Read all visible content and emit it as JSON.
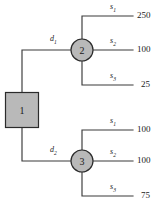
{
  "diagram": {
    "type": "decision-tree",
    "nodes": [
      {
        "id": "1",
        "label": "1",
        "shape": "square",
        "kind": "decision"
      },
      {
        "id": "2",
        "label": "2",
        "shape": "circle",
        "kind": "chance"
      },
      {
        "id": "3",
        "label": "3",
        "shape": "circle",
        "kind": "chance"
      }
    ],
    "decision_branches": [
      {
        "id": "d1",
        "label": "d",
        "sub": "1",
        "from": "1",
        "to": "2"
      },
      {
        "id": "d2",
        "label": "d",
        "sub": "2",
        "from": "1",
        "to": "3"
      }
    ],
    "outcome_branches": [
      {
        "id": "n2-s1",
        "node": "2",
        "label": "s",
        "sub": "1",
        "payoff": "250"
      },
      {
        "id": "n2-s2",
        "node": "2",
        "label": "s",
        "sub": "2",
        "payoff": "100"
      },
      {
        "id": "n2-s3",
        "node": "2",
        "label": "s",
        "sub": "3",
        "payoff": "25"
      },
      {
        "id": "n3-s1",
        "node": "3",
        "label": "s",
        "sub": "1",
        "payoff": "100"
      },
      {
        "id": "n3-s2",
        "node": "3",
        "label": "s",
        "sub": "2",
        "payoff": "100"
      },
      {
        "id": "n3-s3",
        "node": "3",
        "label": "s",
        "sub": "3",
        "payoff": "75"
      }
    ],
    "colors": {
      "node_fill": "#b9b9b9",
      "node_stroke": "#2b2b2b",
      "edge_stroke": "#3a3a3a",
      "text": "#1a1a1a",
      "background": "#ffffff"
    }
  }
}
